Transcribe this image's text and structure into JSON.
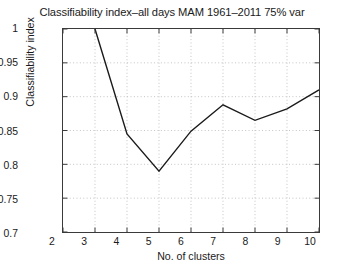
{
  "chart_data": {
    "type": "line",
    "title": "Classifiability index–all days MAM 1961–2011 75% var",
    "xlabel": "No. of clusters",
    "ylabel": "Classifiability index",
    "x": [
      3,
      4,
      5,
      6,
      7,
      8,
      9,
      10
    ],
    "values": [
      1.0,
      0.845,
      0.79,
      0.849,
      0.888,
      0.865,
      0.882,
      0.91
    ],
    "series": [
      {
        "name": "Classifiability index",
        "x": [
          3,
          4,
          5,
          6,
          7,
          8,
          9,
          10
        ],
        "values": [
          1.0,
          0.845,
          0.79,
          0.849,
          0.888,
          0.865,
          0.882,
          0.91
        ]
      }
    ],
    "xlim": [
      2,
      10
    ],
    "ylim": [
      0.7,
      1.0
    ],
    "xticks": [
      2,
      3,
      4,
      5,
      6,
      7,
      8,
      9,
      10
    ],
    "xtick_labels": [
      "2",
      "3",
      "4",
      "5",
      "6",
      "7",
      "8",
      "9",
      "10"
    ],
    "yticks": [
      0.7,
      0.75,
      0.8,
      0.85,
      0.9,
      0.95,
      1.0
    ],
    "ytick_labels": [
      "0.7",
      "0.75",
      "0.8",
      "0.85",
      "0.9",
      "0.95",
      "1"
    ],
    "grid": true,
    "grid_style": "dotted",
    "legend": null,
    "legend_position": "none",
    "line_color": "#1a1a1a",
    "grid_color": "#b4b4b4",
    "axis_color": "#3a3a3a",
    "background_color": "#ffffff",
    "markers": false
  }
}
